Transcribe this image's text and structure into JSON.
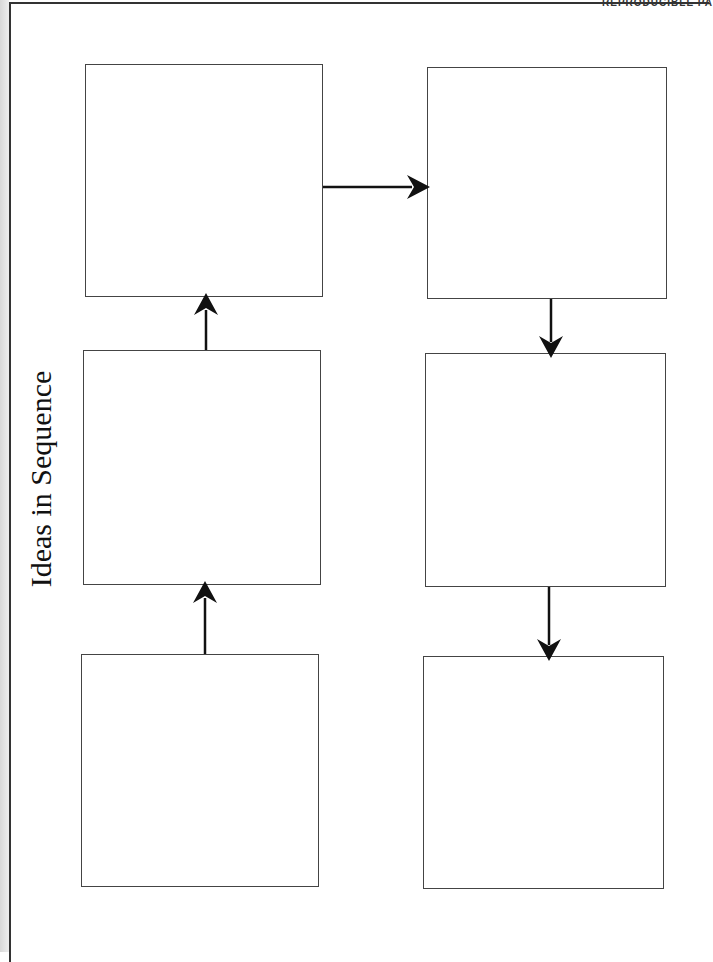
{
  "header": {
    "text": "REPRODUCIBLE PA"
  },
  "title": "Ideas in Sequence",
  "boxes": [
    {
      "id": "box-1",
      "label": "",
      "x": 85,
      "y": 64,
      "w": 238,
      "h": 233
    },
    {
      "id": "box-2",
      "label": "",
      "x": 83,
      "y": 350,
      "w": 238,
      "h": 235
    },
    {
      "id": "box-3",
      "label": "",
      "x": 81,
      "y": 654,
      "w": 238,
      "h": 233
    },
    {
      "id": "box-4",
      "label": "",
      "x": 427,
      "y": 67,
      "w": 240,
      "h": 232
    },
    {
      "id": "box-5",
      "label": "",
      "x": 425,
      "y": 353,
      "w": 241,
      "h": 234
    },
    {
      "id": "box-6",
      "label": "",
      "x": 423,
      "y": 656,
      "w": 241,
      "h": 233
    }
  ],
  "arrows": [
    {
      "from": "box-3",
      "to": "box-2",
      "direction": "up"
    },
    {
      "from": "box-2",
      "to": "box-1",
      "direction": "up"
    },
    {
      "from": "box-1",
      "to": "box-4",
      "direction": "right"
    },
    {
      "from": "box-4",
      "to": "box-5",
      "direction": "down"
    },
    {
      "from": "box-5",
      "to": "box-6",
      "direction": "down"
    }
  ],
  "colors": {
    "line": "#444444",
    "arrow": "#111111",
    "text": "#111111"
  }
}
